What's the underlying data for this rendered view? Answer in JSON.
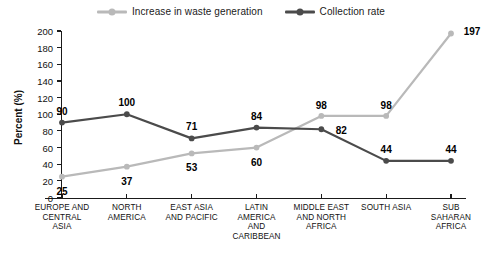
{
  "chart_data": {
    "type": "line",
    "title": "",
    "xlabel": "",
    "ylabel": "Percent (%)",
    "ylim": [
      0,
      200
    ],
    "ytick_step": 20,
    "yticks": [
      0,
      20,
      40,
      60,
      80,
      100,
      120,
      140,
      160,
      180,
      200
    ],
    "grid": false,
    "legend_position": "top-center",
    "categories": [
      "EUROPE AND CENTRAL ASIA",
      "NORTH AMERICA",
      "EAST ASIA AND PACIFIC",
      "LATIN AMERICA AND CARIBBEAN",
      "MIDDLE EAST AND NORTH AFRICA",
      "SOUTH ASIA",
      "SUB SAHARAN AFRICA"
    ],
    "category_lines": [
      [
        "EUROPE AND",
        "CENTRAL",
        "ASIA"
      ],
      [
        "NORTH",
        "AMERICA"
      ],
      [
        "EAST ASIA",
        "AND PACIFIC"
      ],
      [
        "LATIN",
        "AMERICA",
        "AND",
        "CARIBBEAN"
      ],
      [
        "MIDDLE EAST",
        "AND NORTH",
        "AFRICA"
      ],
      [
        "SOUTH ASIA"
      ],
      [
        "SUB",
        "SAHARAN",
        "AFRICA"
      ]
    ],
    "series": [
      {
        "name": "Increase in waste generation",
        "color": "#b9b9b9",
        "values": [
          25,
          37,
          53,
          60,
          98,
          98,
          197
        ]
      },
      {
        "name": "Collection rate",
        "color": "#4b4b4b",
        "values": [
          90,
          100,
          71,
          84,
          82,
          44,
          44
        ]
      }
    ]
  },
  "legend": {
    "items": [
      {
        "label": "Increase in waste generation",
        "color": "#b9b9b9"
      },
      {
        "label": "Collection rate",
        "color": "#4b4b4b"
      }
    ]
  },
  "axis": {
    "y_title": "Percent (%)"
  }
}
